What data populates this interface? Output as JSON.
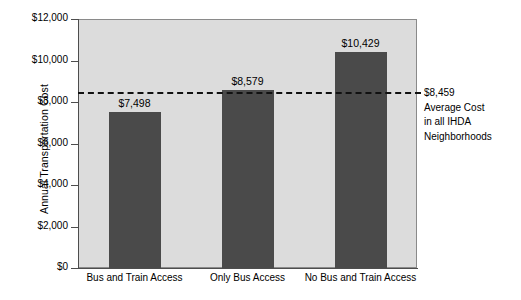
{
  "chart_data": {
    "type": "bar",
    "title": "",
    "subtitle": "",
    "xlabel": "",
    "ylabel": "Annual Transportation Cost",
    "categories": [
      "Bus and Train Access",
      "Only Bus Access",
      "No Bus and Train Access"
    ],
    "values": [
      7498,
      8579,
      10429
    ],
    "value_labels": [
      "$7,498",
      "$8,579",
      "$10,429"
    ],
    "ylim": [
      0,
      12000
    ],
    "ytick_values": [
      0,
      2000,
      4000,
      6000,
      8000,
      10000,
      12000
    ],
    "ytick_labels": [
      "$0",
      "$2,000",
      "$4,000",
      "$6,000",
      "$8,000",
      "$10,000",
      "$12,000"
    ],
    "grid": false,
    "legend": "none",
    "bar_color": "#4a4a4a",
    "plot_background": "#dcdcdc",
    "reference_line": {
      "value": 8459,
      "style": "dashed",
      "color": "#111111",
      "label_lines": [
        "$8,459",
        "Average Cost",
        "in all IHDA",
        "Neighborhoods"
      ]
    }
  }
}
